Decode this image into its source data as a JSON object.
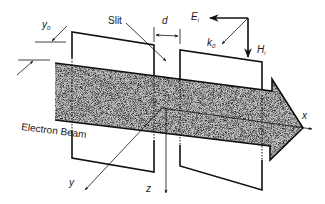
{
  "figure": {
    "type": "physics-schematic"
  },
  "labels": {
    "slit": "Slit",
    "beam": "Electron Beam",
    "y0_main": "y",
    "y0_sub": "0",
    "d": "d",
    "Ei_main": "E",
    "Ei_sub": "i",
    "k0_main": "k",
    "k0_sub": "0",
    "Hi_main": "H",
    "Hi_sub": "i",
    "axis_x": "x",
    "axis_y": "y",
    "axis_z": "z"
  },
  "colors": {
    "line": "#111111",
    "beam_fill": "#b8b8b8",
    "background": "#ffffff"
  }
}
